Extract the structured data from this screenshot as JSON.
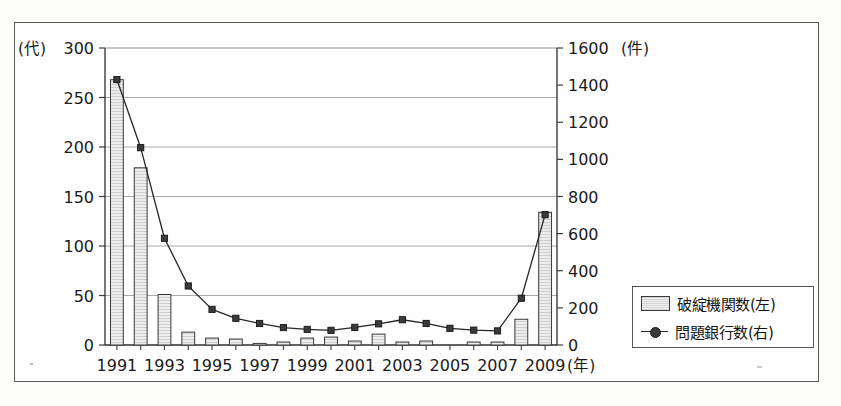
{
  "chart_data": {
    "type": "bar",
    "title": "",
    "subtitle": "",
    "xlabel": "(年)",
    "ylabel_left": "(代)",
    "ylabel_right": "(件)",
    "grid": true,
    "legend_position": "bottom-right",
    "x": [
      1991,
      1992,
      1993,
      1994,
      1995,
      1996,
      1997,
      1998,
      1999,
      2000,
      2001,
      2002,
      2003,
      2004,
      2005,
      2006,
      2007,
      2008,
      2009
    ],
    "categories": [
      "1991",
      "1992",
      "1993",
      "1994",
      "1995",
      "1996",
      "1997",
      "1998",
      "1999",
      "2000",
      "2001",
      "2002",
      "2003",
      "2004",
      "2005",
      "2006",
      "2007",
      "2008",
      "2009"
    ],
    "tick_labels_x": [
      "1991",
      "1993",
      "1995",
      "1997",
      "1999",
      "2001",
      "2003",
      "2005",
      "2007",
      "2009"
    ],
    "ylim_left": [
      0,
      300
    ],
    "ylim_right": [
      0,
      1600
    ],
    "yticks_left": [
      0,
      50,
      100,
      150,
      200,
      250,
      300
    ],
    "yticks_right": [
      0,
      200,
      400,
      600,
      800,
      1000,
      1200,
      1400,
      1600
    ],
    "series": [
      {
        "name": "破綻機関数(左)",
        "type": "bar",
        "axis": "left",
        "unit": "代",
        "values": [
          268,
          179,
          51,
          13,
          7,
          6,
          1,
          3,
          7,
          8,
          4,
          11,
          3,
          4,
          0,
          3,
          3,
          26,
          134
        ]
      },
      {
        "name": "問題銀行数(右)",
        "type": "line",
        "axis": "right",
        "unit": "件",
        "values": [
          1430,
          1063,
          575,
          318,
          192,
          144,
          116,
          94,
          84,
          79,
          95,
          114,
          136,
          116,
          90,
          80,
          76,
          252,
          702
        ]
      }
    ]
  },
  "legend": {
    "items": [
      {
        "label": "破綻機関数(左)",
        "marker": "bar-swatch"
      },
      {
        "label": "問題銀行数(右)",
        "marker": "line-marker-swatch"
      }
    ]
  }
}
